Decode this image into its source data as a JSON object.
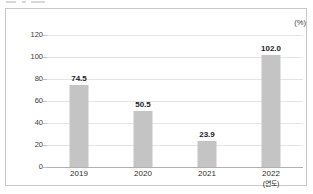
{
  "figure": {
    "unit_label": "(%)",
    "x_axis_note": "(연도)"
  },
  "chart_data": {
    "type": "bar",
    "title": "",
    "subtitle": "",
    "xlabel": "(연도)",
    "ylabel": "(%)",
    "categories": [
      "2019",
      "2020",
      "2021",
      "2022"
    ],
    "values": [
      74.5,
      50.5,
      23.9,
      102.0
    ],
    "value_labels": [
      "74.5",
      "50.5",
      "23.9",
      "102.0"
    ],
    "ylim": [
      0,
      120
    ],
    "ytick_values": [
      120,
      100,
      80,
      60,
      40,
      20,
      0
    ],
    "ytick_labels": [
      "120",
      "100",
      "80",
      "60",
      "40",
      "20",
      "0"
    ],
    "grid": true,
    "grid_axis": "y",
    "legend": false,
    "legend_position": "none",
    "bar_color": "#c4c4c4",
    "gridline_color": "#e4e4e4",
    "axis_color": "#b0b0b0",
    "label_color": "#1c1c1c",
    "orientation": "vertical"
  }
}
